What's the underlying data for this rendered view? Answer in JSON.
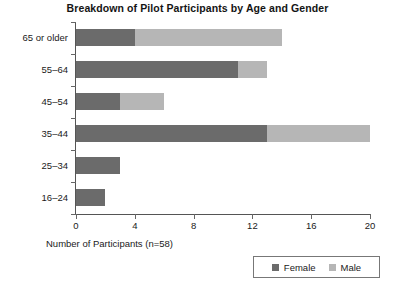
{
  "chart_data": {
    "type": "bar",
    "orientation": "horizontal",
    "stacked": true,
    "title": "Breakdown of Pilot Participants by Age and Gender",
    "xlabel": "Number of Participants (n=58)",
    "ylabel": "",
    "categories": [
      "65 or older",
      "55‒64",
      "45‒54",
      "35‒44",
      "25‒34",
      "16‒24"
    ],
    "series": [
      {
        "name": "Female",
        "color": "#6b6b6b",
        "values": [
          4,
          11,
          3,
          13,
          3,
          2
        ]
      },
      {
        "name": "Male",
        "color": "#b6b6b6",
        "values": [
          10,
          2,
          3,
          7,
          0,
          0
        ]
      }
    ],
    "totals": [
      14,
      13,
      6,
      20,
      3,
      2
    ],
    "xlim": [
      0,
      20
    ],
    "xticks": [
      0,
      4,
      8,
      12,
      16,
      20
    ],
    "xtick_labels": [
      "0",
      "4",
      "8",
      "12",
      "16",
      "20"
    ],
    "grid": false,
    "legend_position": "bottom-right",
    "total_participants": 58
  },
  "legend": {
    "entries": [
      {
        "label": "Female",
        "color": "#6b6b6b"
      },
      {
        "label": "Male",
        "color": "#b6b6b6"
      }
    ]
  }
}
